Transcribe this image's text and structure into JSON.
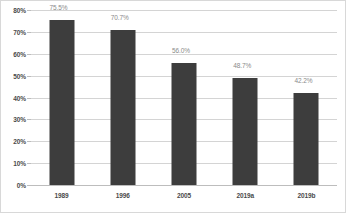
{
  "chart_data": {
    "type": "bar",
    "title": "",
    "subtitle": "",
    "xlabel": "",
    "ylabel": "",
    "categories": [
      "1989",
      "1996",
      "2005",
      "2019a",
      "2019b"
    ],
    "values": [
      75.5,
      70.7,
      56.0,
      48.7,
      42.2
    ],
    "data_labels": [
      "75.5%",
      "70.7%",
      "56.0%",
      "48.7%",
      "42.2%"
    ],
    "ylim": [
      0,
      80
    ],
    "ytick_values": [
      80,
      70,
      60,
      50,
      40,
      30,
      20,
      10,
      0
    ],
    "ytick_labels": [
      "80%",
      "70%",
      "60%",
      "50%",
      "40%",
      "30%",
      "20%",
      "10%",
      "0%"
    ],
    "grid": true,
    "legend": false,
    "legend_position": "none",
    "colors": {
      "bar": "#3d3d3d",
      "gridline": "#d4d4d4",
      "axis": "#bdbdbd",
      "tick_text": "#4a4a4a",
      "data_label_text": "#8a8a8a",
      "background": "#ffffff",
      "border": "#d8d8d8"
    }
  }
}
